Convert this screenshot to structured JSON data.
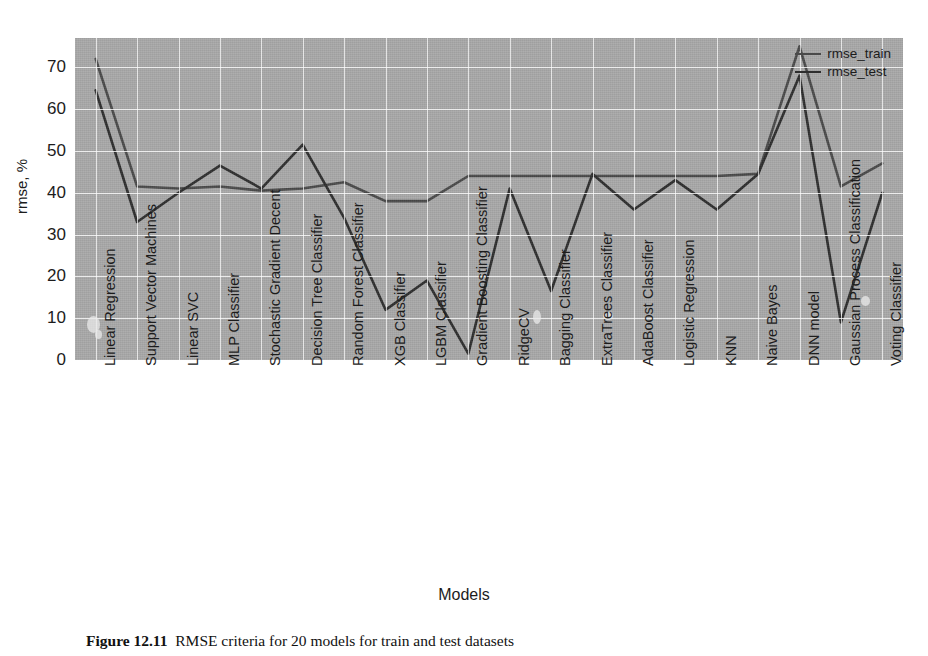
{
  "figure": {
    "caption_label": "Figure 12.11",
    "caption_text": "RMSE criteria for 20 models for train and test datasets"
  },
  "legend": {
    "position": "top-right",
    "items": [
      {
        "label": "rmse_train",
        "color": "#4a4a4a"
      },
      {
        "label": "rmse_test",
        "color": "#2e2e2e"
      }
    ]
  },
  "chart_data": {
    "type": "line",
    "title": "",
    "xlabel": "Models",
    "ylabel": "rmse, %",
    "ylim": [
      0,
      77
    ],
    "yticks": [
      0,
      10,
      20,
      30,
      40,
      50,
      60,
      70
    ],
    "grid": true,
    "legend_position": "upper right",
    "categories": [
      "Linear Regression",
      "Support Vector Machines",
      "Linear SVC",
      "MLP Classifier",
      "Stochastic Gradient Decent",
      "Decision Tree Classifier",
      "Random Forest Classifier",
      "XGB Classifier",
      "LGBM Classifier",
      "Gradient Boosting Classifier",
      "RidgeCV",
      "Bagging Classifier",
      "ExtraTrees Classifier",
      "AdaBoost Classifier",
      "Logistic Regression",
      "KNN",
      "Naive Bayes",
      "DNN model",
      "Gaussian Process Classification",
      "Voting Classifier"
    ],
    "series": [
      {
        "name": "rmse_train",
        "color": "#4a4a4a",
        "values": [
          72.0,
          41.5,
          41.0,
          41.5,
          40.5,
          41.0,
          42.5,
          38.0,
          38.0,
          44.0,
          44.0,
          44.0,
          44.0,
          44.0,
          44.0,
          44.0,
          44.5,
          75.0,
          41.5,
          47.0
        ]
      },
      {
        "name": "rmse_test",
        "color": "#2e2e2e",
        "values": [
          64.5,
          33.0,
          40.0,
          46.5,
          41.0,
          51.5,
          34.0,
          12.0,
          19.0,
          1.5,
          41.0,
          16.5,
          44.5,
          36.0,
          43.0,
          36.0,
          44.5,
          68.0,
          9.0,
          40.0
        ]
      }
    ]
  }
}
